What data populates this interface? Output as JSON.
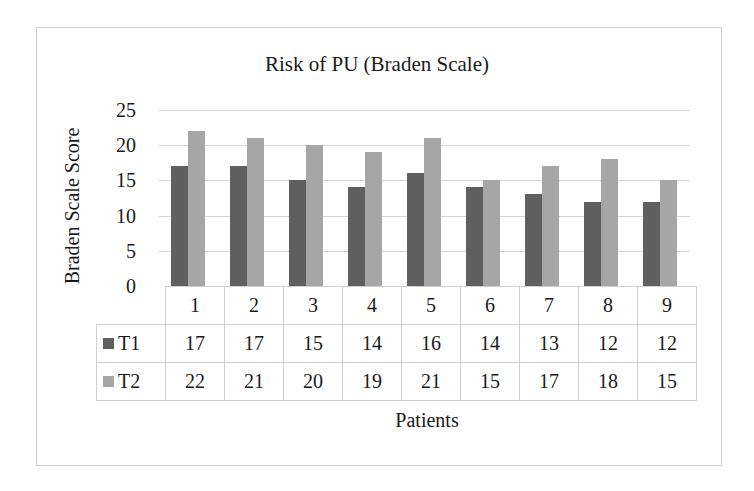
{
  "chart_data": {
    "type": "bar",
    "title": "Risk of PU (Braden Scale)",
    "xlabel": "Patients",
    "ylabel": "Braden Scale Score",
    "ylim": [
      0,
      25
    ],
    "yticks": [
      "0",
      "5",
      "10",
      "15",
      "20",
      "25"
    ],
    "grid": true,
    "legend_position": "data-table",
    "categories": [
      "1",
      "2",
      "3",
      "4",
      "5",
      "6",
      "7",
      "8",
      "9"
    ],
    "series": [
      {
        "name": "T1",
        "color": "#5f5f5f",
        "values": [
          17,
          17,
          15,
          14,
          16,
          14,
          13,
          12,
          12
        ]
      },
      {
        "name": "T2",
        "color": "#a6a6a6",
        "values": [
          22,
          21,
          20,
          19,
          21,
          15,
          17,
          18,
          15
        ]
      }
    ]
  }
}
